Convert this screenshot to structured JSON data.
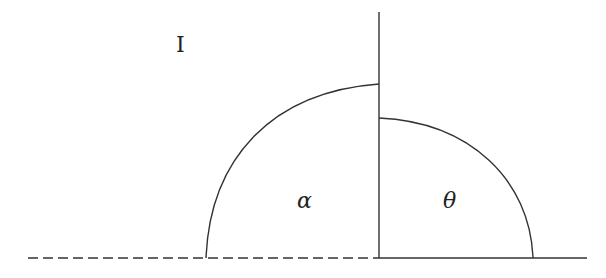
{
  "diagram": {
    "labels": {
      "region_I": "I",
      "alpha": "α",
      "theta": "θ"
    },
    "colors": {
      "line": "#333333",
      "background": "#ffffff"
    },
    "elements": [
      {
        "id": "dashed-baseline",
        "type": "dashed-line",
        "from": [
          28,
          258
        ],
        "to": [
          379,
          258
        ]
      },
      {
        "id": "solid-baseline",
        "type": "line",
        "from": [
          379,
          258
        ],
        "to": [
          587,
          258
        ]
      },
      {
        "id": "vertical-divider",
        "type": "line",
        "from": [
          379,
          12
        ],
        "to": [
          379,
          258
        ]
      },
      {
        "id": "left-arc",
        "type": "curve",
        "from": [
          206,
          258
        ],
        "to": [
          379,
          84
        ],
        "label": "α"
      },
      {
        "id": "right-arc",
        "type": "curve",
        "from": [
          379,
          118
        ],
        "to": [
          533,
          258
        ],
        "label": "θ"
      }
    ]
  }
}
